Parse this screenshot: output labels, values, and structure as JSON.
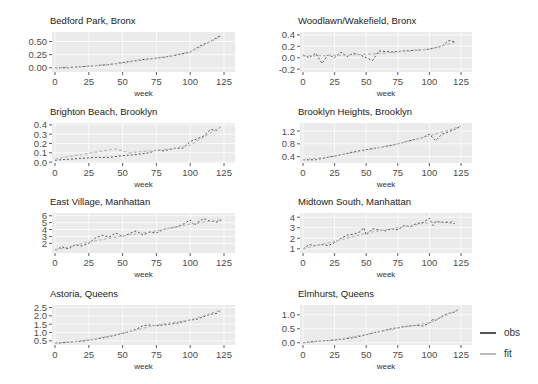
{
  "chart_data": {
    "type": "line",
    "layout": "facet 4x2",
    "xlabel": "week",
    "xlim": [
      0,
      125
    ],
    "xticks": [
      0,
      25,
      50,
      75,
      100,
      125
    ],
    "grid": true,
    "legend_position": "right-bottom",
    "legend": [
      {
        "name": "obs",
        "color": "#555555"
      },
      {
        "name": "fit",
        "color": "#bbbbbb"
      }
    ],
    "panels": [
      {
        "title": "Bedford Park, Bronx",
        "ylim": [
          -0.08,
          0.68
        ],
        "yticks": [
          "0.00",
          "0.25",
          "0.50"
        ],
        "ytick_values": [
          0,
          0.25,
          0.5
        ],
        "series": [
          {
            "name": "obs",
            "x": [
              0,
              10,
              20,
              30,
              40,
              50,
              60,
              70,
              80,
              90,
              100,
              105,
              110,
              115,
              120,
              123
            ],
            "values": [
              0.0,
              0.0,
              0.02,
              0.04,
              0.06,
              0.1,
              0.14,
              0.17,
              0.2,
              0.24,
              0.3,
              0.38,
              0.45,
              0.5,
              0.58,
              0.62
            ]
          },
          {
            "name": "fit",
            "x": [
              0,
              25,
              50,
              75,
              100,
              123
            ],
            "values": [
              0.0,
              0.03,
              0.09,
              0.18,
              0.3,
              0.6
            ]
          }
        ]
      },
      {
        "title": "Woodlawn/Wakefield, Bronx",
        "ylim": [
          -0.25,
          0.45
        ],
        "yticks": [
          "-0.2",
          "0.0",
          "0.2",
          "0.4"
        ],
        "ytick_values": [
          -0.2,
          0,
          0.2,
          0.4
        ],
        "series": [
          {
            "name": "obs",
            "x": [
              0,
              5,
              10,
              15,
              20,
              25,
              30,
              35,
              40,
              45,
              50,
              55,
              60,
              70,
              80,
              90,
              100,
              110,
              115,
              120
            ],
            "values": [
              0.05,
              0.0,
              0.08,
              -0.1,
              0.05,
              0.0,
              0.1,
              0.02,
              0.08,
              0.05,
              0.0,
              -0.05,
              0.12,
              0.1,
              0.12,
              0.13,
              0.15,
              0.2,
              0.3,
              0.28
            ]
          },
          {
            "name": "fit",
            "x": [
              0,
              25,
              50,
              75,
              100,
              120
            ],
            "values": [
              0.03,
              0.04,
              0.06,
              0.1,
              0.15,
              0.27
            ]
          }
        ]
      },
      {
        "title": "Brighton Beach, Brooklyn",
        "ylim": [
          -0.01,
          0.42
        ],
        "yticks": [
          "0.0",
          "0.1",
          "0.2",
          "0.3",
          "0.4"
        ],
        "ytick_values": [
          0,
          0.1,
          0.2,
          0.3,
          0.4
        ],
        "series": [
          {
            "name": "obs",
            "x": [
              0,
              10,
              20,
              30,
              40,
              50,
              60,
              70,
              75,
              80,
              90,
              95,
              100,
              105,
              110,
              115,
              120
            ],
            "values": [
              0.02,
              0.03,
              0.04,
              0.05,
              0.05,
              0.07,
              0.08,
              0.1,
              0.13,
              0.12,
              0.15,
              0.15,
              0.22,
              0.25,
              0.28,
              0.35,
              0.34
            ]
          },
          {
            "name": "fit",
            "x": [
              0,
              10,
              20,
              35,
              45,
              55,
              70,
              85,
              100,
              110,
              123
            ],
            "values": [
              0.03,
              0.06,
              0.08,
              0.12,
              0.14,
              0.1,
              0.12,
              0.14,
              0.18,
              0.27,
              0.38
            ]
          }
        ]
      },
      {
        "title": "Brooklyn Heights, Brooklyn",
        "ylim": [
          0.2,
          1.45
        ],
        "yticks": [
          "0.4",
          "0.8",
          "1.2"
        ],
        "ytick_values": [
          0.4,
          0.8,
          1.2
        ],
        "series": [
          {
            "name": "obs",
            "x": [
              0,
              10,
              20,
              30,
              40,
              50,
              60,
              70,
              80,
              90,
              95,
              100,
              105,
              110,
              120,
              125
            ],
            "values": [
              0.3,
              0.3,
              0.38,
              0.45,
              0.55,
              0.62,
              0.68,
              0.75,
              0.85,
              0.95,
              1.0,
              1.1,
              0.9,
              1.1,
              1.25,
              1.35
            ]
          },
          {
            "name": "fit",
            "x": [
              0,
              25,
              50,
              75,
              100,
              125
            ],
            "values": [
              0.3,
              0.42,
              0.6,
              0.8,
              1.05,
              1.35
            ]
          }
        ]
      },
      {
        "title": "East Village, Manhattan",
        "ylim": [
          0.6,
          6.4
        ],
        "yticks": [
          "2",
          "3",
          "4",
          "5",
          "6"
        ],
        "ytick_values": [
          2,
          3,
          4,
          5,
          6
        ],
        "series": [
          {
            "name": "obs",
            "x": [
              0,
              5,
              10,
              15,
              20,
              25,
              30,
              35,
              40,
              45,
              50,
              55,
              60,
              65,
              70,
              75,
              80,
              85,
              90,
              95,
              100,
              103,
              105,
              110,
              115,
              120,
              123
            ],
            "values": [
              1.0,
              1.5,
              1.2,
              1.8,
              1.6,
              2.0,
              2.8,
              3.2,
              2.9,
              3.5,
              3.0,
              3.4,
              3.8,
              3.2,
              3.6,
              3.5,
              4.0,
              4.2,
              4.4,
              4.8,
              5.4,
              4.6,
              5.0,
              5.6,
              5.2,
              5.1,
              5.4
            ]
          },
          {
            "name": "fit",
            "x": [
              0,
              25,
              50,
              75,
              100,
              123
            ],
            "values": [
              1.0,
              2.2,
              3.1,
              3.8,
              4.8,
              5.4
            ]
          }
        ]
      },
      {
        "title": "Midtown South, Manhattan",
        "ylim": [
          0.6,
          4.4
        ],
        "yticks": [
          "1",
          "2",
          "3",
          "4"
        ],
        "ytick_values": [
          1,
          2,
          3,
          4
        ],
        "series": [
          {
            "name": "obs",
            "x": [
              0,
              5,
              10,
              15,
              20,
              25,
              30,
              35,
              40,
              45,
              48,
              50,
              55,
              60,
              65,
              70,
              75,
              80,
              85,
              90,
              95,
              100,
              103,
              105,
              110,
              115,
              120
            ],
            "values": [
              1.0,
              1.4,
              1.3,
              1.4,
              1.3,
              1.6,
              2.0,
              2.3,
              2.4,
              2.6,
              3.0,
              2.3,
              2.9,
              2.8,
              2.7,
              2.9,
              2.8,
              3.2,
              3.1,
              3.4,
              3.5,
              3.9,
              3.2,
              3.6,
              3.5,
              3.5,
              3.4
            ]
          },
          {
            "name": "fit",
            "x": [
              0,
              25,
              50,
              75,
              100,
              120
            ],
            "values": [
              1.0,
              1.7,
              2.5,
              3.0,
              3.5,
              3.6
            ]
          }
        ]
      },
      {
        "title": "Astoria, Queens",
        "ylim": [
          0.25,
          2.65
        ],
        "yticks": [
          "0.5",
          "1.0",
          "1.5",
          "2.0",
          "2.5"
        ],
        "ytick_values": [
          0.5,
          1.0,
          1.5,
          2.0,
          2.5
        ],
        "series": [
          {
            "name": "obs",
            "x": [
              0,
              10,
              20,
              30,
              40,
              50,
              55,
              60,
              65,
              70,
              75,
              80,
              90,
              95,
              100,
              105,
              110,
              115,
              120,
              123
            ],
            "values": [
              0.35,
              0.42,
              0.48,
              0.6,
              0.75,
              0.95,
              1.05,
              1.2,
              1.4,
              1.45,
              1.4,
              1.45,
              1.55,
              1.65,
              1.75,
              1.8,
              1.95,
              2.1,
              2.15,
              2.4
            ]
          },
          {
            "name": "fit",
            "x": [
              0,
              25,
              50,
              75,
              100,
              123
            ],
            "values": [
              0.35,
              0.55,
              0.95,
              1.45,
              1.75,
              2.35
            ]
          }
        ]
      },
      {
        "title": "Elmhurst, Queens",
        "ylim": [
          -0.08,
          1.35
        ],
        "yticks": [
          "0.0",
          "0.5",
          "1.0"
        ],
        "ytick_values": [
          0,
          0.5,
          1.0
        ],
        "series": [
          {
            "name": "obs",
            "x": [
              0,
              10,
              20,
              30,
              40,
              50,
              55,
              60,
              70,
              80,
              90,
              95,
              100,
              103,
              105,
              110,
              115,
              120,
              123
            ],
            "values": [
              0.0,
              0.05,
              0.08,
              0.12,
              0.18,
              0.28,
              0.35,
              0.4,
              0.5,
              0.58,
              0.62,
              0.6,
              0.7,
              0.85,
              0.8,
              0.95,
              1.05,
              1.1,
              1.2
            ]
          },
          {
            "name": "fit",
            "x": [
              0,
              25,
              50,
              75,
              100,
              123
            ],
            "values": [
              0.0,
              0.1,
              0.3,
              0.52,
              0.72,
              1.18
            ]
          }
        ]
      }
    ]
  },
  "legend": {
    "obs_label": "obs",
    "fit_label": "fit"
  }
}
